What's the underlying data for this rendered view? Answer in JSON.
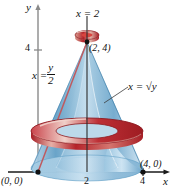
{
  "figure": {
    "kind": "solid-of-revolution-diagram",
    "axes": {
      "y_axis_label": "y",
      "x_axis_label": "x",
      "y_ticks": [
        {
          "label": "4",
          "value": 4
        }
      ],
      "x_ticks": [
        {
          "label": "2",
          "value": 2
        },
        {
          "label": "4",
          "value": 4
        }
      ]
    },
    "labels": {
      "top_line": "x = 2",
      "left_curve_lhs": "x =",
      "left_curve_num": "y",
      "left_curve_den": "2",
      "right_curve": "x = √y",
      "origin_point": "(0, 0)",
      "apex_point": "(2, 4)",
      "x_intercept_point": "(4, 0)"
    },
    "colors": {
      "solid_blue_light": "#cfe4f2",
      "solid_blue_mid": "#7fb6d8",
      "solid_blue_dark": "#4f8cb5",
      "washer_red": "#b5232a",
      "washer_red_light": "#e8a79c",
      "line_pink": "#c6656a",
      "region_fill": "#e6e0dd",
      "axis_gray": "#808080",
      "axis_black": "#1a1a1a"
    }
  }
}
